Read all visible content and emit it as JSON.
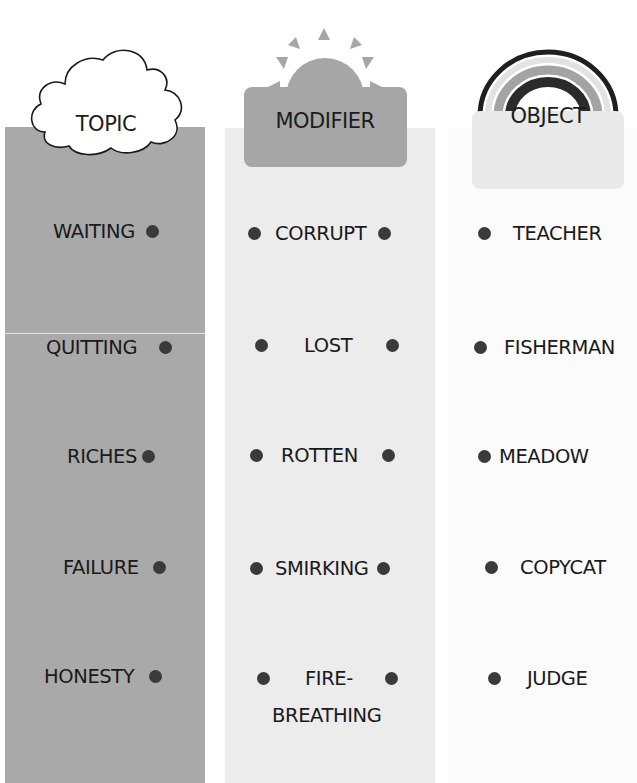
{
  "columns": {
    "topic": {
      "header": "TOPIC",
      "header_icon": "cloud-icon",
      "items": [
        "WAITING",
        "QUITTING",
        "RICHES",
        "FAILURE",
        "HONESTY"
      ]
    },
    "modifier": {
      "header": "MODIFIER",
      "header_icon": "sun-icon",
      "items": [
        "CORRUPT",
        "LOST",
        "ROTTEN",
        "SMIRKING",
        "FIRE-",
        "BREATHING"
      ]
    },
    "object": {
      "header": "OBJECT",
      "header_icon": "rainbow-icon",
      "items": [
        "TEACHER",
        "FISHERMAN",
        "MEADOW",
        "COPYCAT",
        "JUDGE"
      ]
    }
  },
  "colors": {
    "topic_bg": "#a9a9a9",
    "modifier_bg": "#ececec",
    "object_bg": "#fbfbfb",
    "dot": "#3a3a3a"
  }
}
